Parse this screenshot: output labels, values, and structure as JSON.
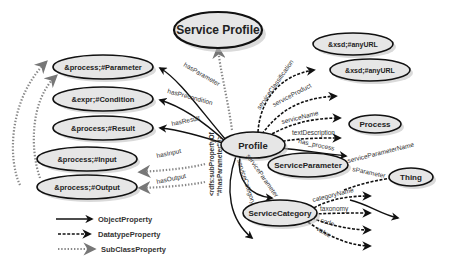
{
  "diagram": {
    "title": "Service Profile",
    "central_node": "Profile",
    "nodes": {
      "service_profile": "Service Profile",
      "profile": "Profile",
      "parameter": "&process;#Parameter",
      "condition": "&expr;#Condition",
      "result": "&process;#Result",
      "input": "&process;#Input",
      "output": "&process;#Output",
      "anyurl_1": "&xsd;#anyURL",
      "anyurl_2": "&xsd;#anyURL",
      "process": "Process",
      "service_parameter": "ServiceParameter",
      "thing": "Thing",
      "service_category": "ServiceCategory"
    },
    "edges": {
      "has_parameter": "hasParameter",
      "has_precondition": "hasPrecondition",
      "has_result": "hasResult",
      "has_input": "hasInput",
      "has_output": "hasOutput",
      "service_classification": "serviceClassification",
      "service_product": "serviceProduct",
      "service_name": "serviceName",
      "text_description": "textDescription",
      "has_process": "has_process",
      "service_parameter": "serviceParameter",
      "service_category": "serviceCategory",
      "service_parameter_name": "serviceParameterName",
      "s_parameter": "sParameter",
      "category_name": "categoryName",
      "taxonomy": "taxonomy",
      "code": "code",
      "value": "value"
    },
    "annotation": {
      "line1": "<rdfs:subPropertyOf",
      "line2": "\"#hasParameter\" />"
    },
    "legend": [
      {
        "label": "ObjectProperty",
        "style": "solid"
      },
      {
        "label": "DatatypeProperty",
        "style": "dashed"
      },
      {
        "label": "SubClassProperty",
        "style": "dotted"
      }
    ]
  }
}
